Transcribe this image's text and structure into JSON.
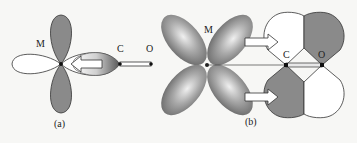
{
  "figure": {
    "panel_a": {
      "caption": "(a)",
      "metal_label": "M",
      "carbon_label": "C",
      "oxygen_label": "O",
      "description": "sigma donation from CO lone pair into empty metal d orbital"
    },
    "panel_b": {
      "caption": "(b)",
      "metal_label": "M",
      "carbon_label": "C",
      "oxygen_label": "O",
      "description": "pi back-donation from filled metal d orbital into CO pi* orbital"
    },
    "colors": {
      "shaded_lobe": "#8a8a8a",
      "empty_lobe": "#ffffff",
      "outline": "#333333",
      "background": "#f7f7f5"
    }
  }
}
